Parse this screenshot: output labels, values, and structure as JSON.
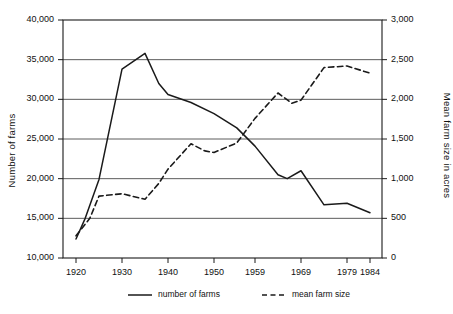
{
  "chart_data": {
    "type": "line",
    "title": "",
    "xlabel": "",
    "grid": "horizontal",
    "legend_position": "bottom",
    "x_ticks": [
      "1920",
      "1930",
      "1940",
      "1950",
      "1959",
      "1969",
      "1979",
      "1984"
    ],
    "axes": {
      "left": {
        "label": "Number of farms",
        "ticks": [
          "10,000",
          "15,000",
          "20,000",
          "25,000",
          "30,000",
          "35,000",
          "40,000"
        ],
        "ylim": [
          10000,
          40000
        ]
      },
      "right": {
        "label": "Mean farm size in acres",
        "ticks": [
          "0",
          "500",
          "1,000",
          "1,500",
          "2,000",
          "2,500",
          "3,000"
        ],
        "ylim": [
          0,
          3000
        ]
      }
    },
    "series": [
      {
        "name": "number of farms",
        "axis": "left",
        "style": "solid",
        "color": "#1a1a1a",
        "x": [
          1920,
          1922,
          1925,
          1930,
          1935,
          1938,
          1940,
          1945,
          1950,
          1955,
          1959,
          1964,
          1966,
          1969,
          1974,
          1979,
          1984
        ],
        "values": [
          12400,
          15000,
          19900,
          33800,
          35800,
          32000,
          30600,
          29600,
          28200,
          26400,
          24100,
          20500,
          20000,
          21000,
          16700,
          16900,
          15700
        ]
      },
      {
        "name": "mean farm size",
        "axis": "right",
        "style": "dashed",
        "color": "#1a1a1a",
        "x": [
          1920,
          1923,
          1925,
          1930,
          1935,
          1938,
          1940,
          1945,
          1948,
          1950,
          1955,
          1959,
          1964,
          1967,
          1969,
          1974,
          1979,
          1984
        ],
        "values": [
          280,
          500,
          780,
          810,
          740,
          940,
          1120,
          1440,
          1350,
          1330,
          1450,
          1760,
          2080,
          1950,
          1990,
          2400,
          2420,
          2330
        ]
      }
    ]
  },
  "legend": {
    "items": [
      {
        "label": "number of farms",
        "style": "solid"
      },
      {
        "label": "mean farm size",
        "style": "dashed"
      }
    ]
  }
}
